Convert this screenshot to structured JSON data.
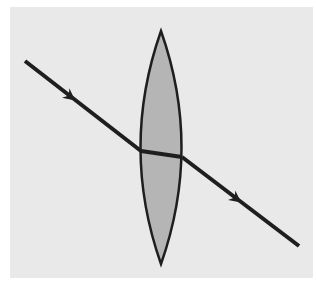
{
  "diagram": {
    "type": "optics-ray-diagram",
    "colors": {
      "page_background": "#ffffff",
      "panel_background": "#e9e9e9",
      "lens_fill": "#b5b5b5",
      "stroke": "#1e1e1e"
    },
    "lens": {
      "shape": "biconvex",
      "top_tip": [
        161,
        31
      ],
      "bottom_tip": [
        161,
        264
      ],
      "left_extent_x": 140,
      "right_extent_x": 183
    },
    "ray": {
      "incident": {
        "start": [
          25,
          61
        ],
        "end": [
          141,
          151
        ]
      },
      "inside_lens": {
        "start": [
          141,
          151
        ],
        "end": [
          182,
          157
        ]
      },
      "emergent": {
        "start": [
          182,
          157
        ],
        "end": [
          299,
          246
        ]
      },
      "arrows": [
        {
          "position": [
            72,
            98
          ],
          "direction": "down-right"
        },
        {
          "position": [
            238,
            200
          ],
          "direction": "down-right"
        }
      ]
    }
  }
}
